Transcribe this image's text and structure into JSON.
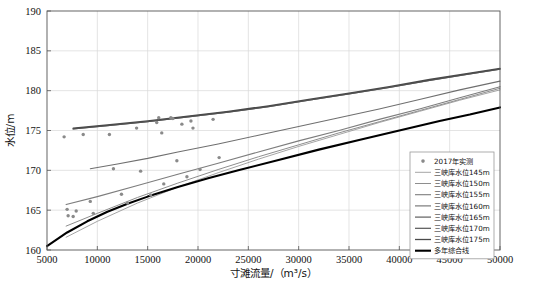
{
  "chart_data": {
    "type": "line",
    "title": "",
    "xlabel": "寸滩流量/（m³/s）",
    "ylabel": "水位/m",
    "xlim": [
      5000,
      50000
    ],
    "ylim": [
      160,
      190
    ],
    "xticks": [
      5000,
      10000,
      15000,
      20000,
      25000,
      30000,
      35000,
      40000,
      45000,
      50000
    ],
    "yticks": [
      160,
      165,
      170,
      175,
      180,
      185,
      190
    ],
    "grid": true,
    "legend_position": "bottom-right",
    "scatter": {
      "name": "2017年实测",
      "marker": "circle",
      "color": "#8a8a8a",
      "points": [
        [
          6700,
          174.2
        ],
        [
          7000,
          165.1
        ],
        [
          7100,
          164.3
        ],
        [
          7600,
          164.2
        ],
        [
          7900,
          164.9
        ],
        [
          8600,
          174.5
        ],
        [
          9300,
          166.1
        ],
        [
          9600,
          164.6
        ],
        [
          11200,
          174.5
        ],
        [
          11600,
          170.2
        ],
        [
          12400,
          167.0
        ],
        [
          13000,
          165.9
        ],
        [
          13900,
          175.3
        ],
        [
          14300,
          169.9
        ],
        [
          15300,
          166.9
        ],
        [
          15900,
          176.0
        ],
        [
          16100,
          176.6
        ],
        [
          16400,
          174.7
        ],
        [
          16600,
          168.3
        ],
        [
          17300,
          176.6
        ],
        [
          17500,
          176.5
        ],
        [
          17900,
          171.2
        ],
        [
          18400,
          175.8
        ],
        [
          18900,
          169.2
        ],
        [
          19300,
          176.2
        ],
        [
          19500,
          175.3
        ],
        [
          20200,
          170.1
        ],
        [
          21500,
          176.4
        ],
        [
          22100,
          171.6
        ]
      ]
    },
    "series": [
      {
        "name": "三峡库水位145m",
        "color": "#9b9b9b",
        "width": 0.9,
        "x": [
          6900,
          10000,
          14000,
          18000,
          22000,
          26000,
          30000,
          34000,
          38000,
          42000,
          46000,
          50000
        ],
        "y": [
          161.6,
          163.6,
          165.9,
          167.9,
          169.7,
          171.4,
          173.0,
          174.5,
          176.0,
          177.4,
          178.8,
          180.1
        ]
      },
      {
        "name": "三峡库水位150m",
        "color": "#8e8e8e",
        "width": 1.0,
        "x": [
          6900,
          10000,
          14000,
          18000,
          22000,
          26000,
          30000,
          34000,
          38000,
          42000,
          46000,
          50000
        ],
        "y": [
          163.0,
          164.6,
          166.6,
          168.4,
          170.1,
          171.7,
          173.2,
          174.7,
          176.1,
          177.5,
          178.9,
          180.3
        ]
      },
      {
        "name": "三峡库水位155m",
        "color": "#7d7d7d",
        "width": 1.1,
        "x": [
          6900,
          10000,
          14000,
          18000,
          22000,
          26000,
          30000,
          34000,
          38000,
          42000,
          46000,
          50000
        ],
        "y": [
          165.7,
          166.7,
          168.1,
          169.5,
          170.9,
          172.3,
          173.7,
          175.0,
          176.4,
          177.7,
          179.1,
          180.5
        ]
      },
      {
        "name": "三峡库水位160m",
        "color": "#6f6f6f",
        "width": 1.1,
        "x": [
          9300,
          12000,
          15000,
          18000,
          22000,
          26000,
          30000,
          34000,
          38000,
          42000,
          46000,
          50000
        ],
        "y": [
          170.2,
          170.8,
          171.5,
          172.3,
          173.3,
          174.4,
          175.5,
          176.6,
          177.7,
          178.9,
          180.1,
          181.2
        ]
      },
      {
        "name": "三峡库水位165m",
        "color": "#5f5f5f",
        "width": 1.2,
        "x": [
          7600,
          11000,
          15000,
          19000,
          23000,
          27000,
          31000,
          35000,
          39000,
          43000,
          47000,
          50000
        ],
        "y": [
          175.2,
          175.6,
          176.1,
          176.7,
          177.3,
          178.0,
          178.8,
          179.6,
          180.4,
          181.3,
          182.1,
          182.7
        ]
      },
      {
        "name": "三峡库水位170m",
        "color": "#555555",
        "width": 1.2,
        "x": [
          7600,
          11000,
          15000,
          19000,
          23000,
          27000,
          31000,
          35000,
          39000,
          43000,
          47000,
          50000
        ],
        "y": [
          175.2,
          175.6,
          176.1,
          176.7,
          177.3,
          178.0,
          178.8,
          179.6,
          180.4,
          181.3,
          182.1,
          182.7
        ]
      },
      {
        "name": "三峡库水位175m",
        "color": "#4a4a4a",
        "width": 1.3,
        "x": [
          7600,
          11000,
          15000,
          19000,
          23000,
          27000,
          31000,
          35000,
          39000,
          43000,
          47000,
          50000
        ],
        "y": [
          175.3,
          175.7,
          176.2,
          176.8,
          177.4,
          178.1,
          178.9,
          179.7,
          180.5,
          181.4,
          182.2,
          182.8
        ]
      },
      {
        "name": "多年综合线",
        "color": "#000000",
        "width": 2.1,
        "x": [
          5000,
          7000,
          9000,
          11000,
          13000,
          15000,
          18000,
          21000,
          24000,
          28000,
          32000,
          36000,
          40000,
          44000,
          47000,
          50000
        ],
        "y": [
          160.5,
          162.2,
          163.6,
          164.8,
          165.8,
          166.7,
          167.9,
          169.0,
          170.0,
          171.3,
          172.6,
          173.8,
          175.0,
          176.2,
          177.0,
          177.9
        ]
      }
    ]
  },
  "legend": {
    "items": [
      {
        "label": "2017年实测",
        "type": "marker"
      },
      {
        "label": "三峡库水位145m",
        "type": "line"
      },
      {
        "label": "三峡库水位150m",
        "type": "line"
      },
      {
        "label": "三峡库水位155m",
        "type": "line"
      },
      {
        "label": "三峡库水位160m",
        "type": "line"
      },
      {
        "label": "三峡库水位165m",
        "type": "line"
      },
      {
        "label": "三峡库水位170m",
        "type": "line"
      },
      {
        "label": "三峡库水位175m",
        "type": "line"
      },
      {
        "label": "多年综合线",
        "type": "line"
      }
    ]
  }
}
